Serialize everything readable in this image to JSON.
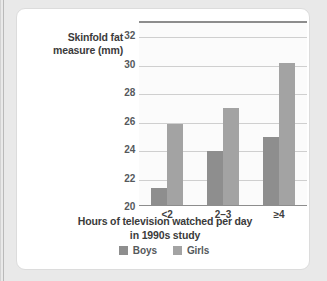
{
  "chart_data": {
    "type": "bar",
    "title": "",
    "categories": [
      "<2",
      "2–3",
      "≥4"
    ],
    "series": [
      {
        "name": "Boys",
        "color": "#8e8e8e",
        "values": [
          21.2,
          23.8,
          24.8
        ]
      },
      {
        "name": "Girls",
        "color": "#a3a3a3",
        "values": [
          25.7,
          26.8,
          30.0
        ]
      }
    ],
    "ylabel": "Skinfold fat\nmeasure (mm)",
    "ylabel_line1": "Skinfold fat",
    "ylabel_line2": "measure (mm)",
    "xlabel": "Hours of television watched per day in 1990s study",
    "xlabel_line1": "Hours of television watched per day",
    "xlabel_line2": "in 1990s study",
    "ylim": [
      20,
      33
    ],
    "yticks": [
      20,
      22,
      24,
      26,
      28,
      30,
      32
    ],
    "ytick_labels": [
      "20",
      "22",
      "24",
      "26",
      "28",
      "30",
      "32"
    ],
    "grid": true,
    "legend_position": "bottom-center"
  },
  "legend": {
    "items": [
      {
        "label": "Boys",
        "color": "#8e8e8e"
      },
      {
        "label": "Girls",
        "color": "#a3a3a3"
      }
    ]
  }
}
